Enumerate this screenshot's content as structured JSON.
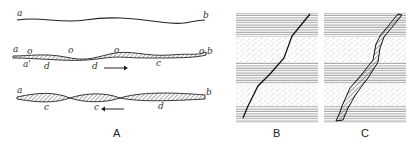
{
  "figure": {
    "panels": [
      {
        "id": "A",
        "caption": "A"
      },
      {
        "id": "B",
        "caption": "B"
      },
      {
        "id": "C",
        "caption": "C"
      }
    ],
    "panelA": {
      "row1": {
        "left": "a",
        "right": "b"
      },
      "row2": {
        "left": "a",
        "right": "b",
        "o_marks": [
          "o",
          "o",
          "o",
          "o"
        ],
        "below": [
          "a'",
          "d",
          "d",
          "c"
        ],
        "arrow": "right"
      },
      "row3": {
        "left": "a",
        "right": "b",
        "below": [
          "c",
          "c",
          "d"
        ],
        "arrow": "left"
      }
    },
    "panelB": {
      "bands": [
        "lined",
        "dotted",
        "lined",
        "dotted",
        "lined"
      ]
    },
    "panelC": {
      "bands": [
        "lined",
        "dotted",
        "lined",
        "dotted",
        "lined"
      ]
    },
    "colors": {
      "ink": "#222222",
      "hatch": "#555555",
      "background": "#ffffff"
    }
  }
}
